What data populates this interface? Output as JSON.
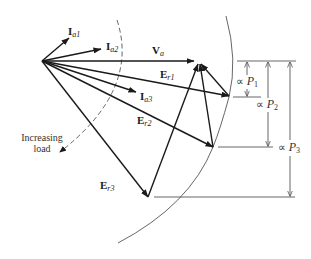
{
  "diagram": {
    "title": "",
    "vectors": [
      {
        "id": "Ia1",
        "main": "I",
        "sub": "a1"
      },
      {
        "id": "Ia2",
        "main": "I",
        "sub": "a2"
      },
      {
        "id": "Va",
        "main": "V",
        "sub": "a"
      },
      {
        "id": "Er1",
        "main": "E",
        "sub": "r1"
      },
      {
        "id": "Ia3",
        "main": "I",
        "sub": "a3"
      },
      {
        "id": "Er2",
        "main": "E",
        "sub": "r2"
      },
      {
        "id": "Er3",
        "main": "E",
        "sub": "r3"
      }
    ],
    "annotation": {
      "line1": "Increasing",
      "line2": "load"
    },
    "dimensions": [
      {
        "id": "P1",
        "prefix": "∝ ",
        "var": "P",
        "sub": "1"
      },
      {
        "id": "P2",
        "prefix": "∝ ",
        "var": "P",
        "sub": "2"
      },
      {
        "id": "P3",
        "prefix": "∝ ",
        "var": "P",
        "sub": "3"
      }
    ],
    "colors": {
      "stroke": "#1a1a1a",
      "thin": "#555555"
    }
  }
}
